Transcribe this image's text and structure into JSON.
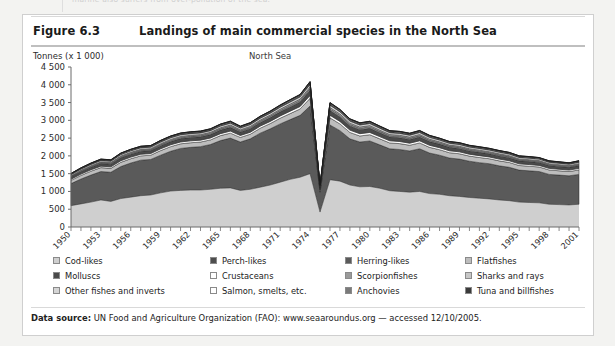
{
  "page": {
    "cut_off_top_fragment": "marine also suffers from over-pollution of the sea."
  },
  "figure": {
    "number_label": "Figure 6.3",
    "title": "Landings of main commercial species in the North Sea",
    "footer_prefix": "Data source:",
    "footer_text": " UN Food and Agriculture Organization (FAO): www.seaaroundus.org — accessed 12/10/2005."
  },
  "colors": {
    "cod_likes": "#cfcfcf",
    "perch_likes": "#4d4d4d",
    "herring_likes": "#5a5a5a",
    "flatfishes": "#bdbdbd",
    "molluscs": "#4a4a4a",
    "crustaceans": "#ffffff",
    "scorpionfishes": "#9a9a9a",
    "sharks_and_rays": "#c7c7c7",
    "other_fishes_and_inverts": "#d5d5d5",
    "salmon_smelts": "#ffffff",
    "anchovies": "#7a7a7a",
    "tuna_and_billfishes": "#3a3a3a",
    "axis": "#6b6b6b",
    "outline": "#1a1a1a",
    "panel_border": "#cfcfcf"
  },
  "legend": {
    "rows": [
      [
        {
          "label": "Cod-likes",
          "color_key": "cod_likes"
        },
        {
          "label": "Perch-likes",
          "color_key": "perch_likes"
        },
        {
          "label": "Herring-likes",
          "color_key": "herring_likes"
        },
        {
          "label": "Flatfishes",
          "color_key": "flatfishes"
        }
      ],
      [
        {
          "label": "Molluscs",
          "color_key": "molluscs"
        },
        {
          "label": "Crustaceans",
          "color_key": "crustaceans"
        },
        {
          "label": "Scorpionfishes",
          "color_key": "scorpionfishes"
        },
        {
          "label": "Sharks and rays",
          "color_key": "sharks_and_rays"
        }
      ],
      [
        {
          "label": "Other fishes and inverts",
          "color_key": "other_fishes_and_inverts"
        },
        {
          "label": "Salmon, smelts, etc.",
          "color_key": "salmon_smelts"
        },
        {
          "label": "Anchovies",
          "color_key": "anchovies"
        },
        {
          "label": "Tuna and billfishes",
          "color_key": "tuna_and_billfishes"
        }
      ]
    ]
  },
  "chart_data": {
    "type": "area",
    "stacked": true,
    "title": "North Sea",
    "xlabel": "",
    "ylabel": "Tonnes (x 1 000)",
    "ylim": [
      0,
      4500
    ],
    "yticks": [
      0,
      500,
      1000,
      1500,
      2000,
      2500,
      3000,
      3500,
      4000,
      4500
    ],
    "ytick_labels": [
      "0",
      "500",
      "1 000",
      "1 500",
      "2 000",
      "2 500",
      "3 000",
      "3 500",
      "4 000",
      "4 500"
    ],
    "grid": false,
    "legend_position": "below",
    "x": [
      1950,
      1951,
      1952,
      1953,
      1954,
      1955,
      1956,
      1957,
      1958,
      1959,
      1960,
      1961,
      1962,
      1963,
      1964,
      1965,
      1966,
      1967,
      1968,
      1969,
      1970,
      1971,
      1972,
      1973,
      1974,
      1975,
      1976,
      1977,
      1978,
      1979,
      1980,
      1981,
      1982,
      1983,
      1984,
      1985,
      1986,
      1987,
      1988,
      1989,
      1990,
      1991,
      1992,
      1993,
      1994,
      1995,
      1996,
      1997,
      1998,
      1999,
      2000,
      2001
    ],
    "xtick_labels": [
      "1950",
      "1953",
      "1956",
      "1959",
      "1962",
      "1965",
      "1968",
      "1971",
      "1974",
      "1977",
      "1980",
      "1983",
      "1986",
      "1989",
      "1992",
      "1995",
      "1998",
      "2001"
    ],
    "series": [
      {
        "name": "Cod-likes",
        "color_key": "cod_likes",
        "values": [
          600,
          650,
          700,
          760,
          720,
          800,
          840,
          880,
          900,
          960,
          1010,
          1030,
          1040,
          1040,
          1060,
          1090,
          1100,
          1030,
          1060,
          1120,
          1180,
          1260,
          1340,
          1400,
          1500,
          420,
          1330,
          1290,
          1180,
          1130,
          1140,
          1090,
          1020,
          1000,
          980,
          1000,
          940,
          920,
          880,
          860,
          830,
          810,
          790,
          760,
          740,
          700,
          690,
          680,
          640,
          630,
          620,
          640
        ]
      },
      {
        "name": "Herring-likes",
        "color_key": "herring_likes",
        "values": [
          620,
          700,
          760,
          800,
          820,
          900,
          960,
          1000,
          1000,
          1060,
          1120,
          1180,
          1200,
          1220,
          1260,
          1340,
          1400,
          1360,
          1420,
          1520,
          1580,
          1640,
          1680,
          1740,
          1900,
          560,
          1540,
          1420,
          1300,
          1260,
          1280,
          1220,
          1180,
          1180,
          1160,
          1200,
          1140,
          1100,
          1060,
          1050,
          1020,
          1000,
          990,
          960,
          940,
          900,
          890,
          880,
          840,
          830,
          820,
          840
        ]
      },
      {
        "name": "Flatfishes",
        "color_key": "flatfishes",
        "values": [
          90,
          100,
          110,
          110,
          110,
          120,
          120,
          120,
          120,
          130,
          130,
          130,
          130,
          130,
          130,
          140,
          140,
          130,
          130,
          140,
          150,
          160,
          170,
          180,
          220,
          60,
          200,
          190,
          180,
          170,
          175,
          170,
          165,
          165,
          160,
          165,
          160,
          155,
          150,
          150,
          145,
          145,
          140,
          140,
          135,
          130,
          130,
          128,
          125,
          122,
          120,
          125
        ]
      },
      {
        "name": "Crustaceans",
        "color_key": "crustaceans",
        "values": [
          35,
          38,
          40,
          42,
          42,
          45,
          46,
          47,
          47,
          50,
          52,
          52,
          53,
          53,
          54,
          56,
          58,
          55,
          56,
          58,
          60,
          64,
          68,
          70,
          80,
          22,
          74,
          70,
          66,
          64,
          65,
          62,
          60,
          60,
          58,
          60,
          58,
          56,
          54,
          54,
          52,
          52,
          50,
          50,
          48,
          46,
          46,
          45,
          44,
          43,
          42,
          44
        ]
      },
      {
        "name": "Molluscs",
        "color_key": "molluscs",
        "values": [
          60,
          66,
          70,
          74,
          74,
          80,
          82,
          84,
          84,
          88,
          92,
          94,
          95,
          95,
          96,
          100,
          104,
          98,
          100,
          104,
          108,
          114,
          120,
          126,
          145,
          40,
          132,
          126,
          118,
          114,
          116,
          110,
          106,
          106,
          104,
          108,
          104,
          100,
          98,
          96,
          94,
          94,
          90,
          90,
          88,
          84,
          84,
          82,
          80,
          78,
          76,
          80
        ]
      },
      {
        "name": "Scorpionfishes",
        "color_key": "scorpionfishes",
        "values": [
          20,
          22,
          24,
          25,
          25,
          27,
          28,
          28,
          28,
          30,
          31,
          32,
          32,
          32,
          33,
          34,
          35,
          33,
          34,
          35,
          37,
          39,
          41,
          43,
          50,
          14,
          45,
          43,
          40,
          39,
          40,
          38,
          36,
          36,
          35,
          37,
          35,
          34,
          33,
          33,
          32,
          32,
          31,
          31,
          30,
          29,
          29,
          28,
          27,
          27,
          26,
          27
        ]
      },
      {
        "name": "Sharks and rays",
        "color_key": "sharks_and_rays",
        "values": [
          18,
          20,
          21,
          22,
          22,
          24,
          25,
          25,
          25,
          26,
          28,
          28,
          29,
          29,
          29,
          30,
          31,
          29,
          30,
          31,
          33,
          35,
          37,
          38,
          44,
          12,
          40,
          38,
          36,
          35,
          36,
          34,
          33,
          33,
          32,
          33,
          32,
          30,
          29,
          29,
          28,
          28,
          27,
          27,
          26,
          25,
          25,
          25,
          24,
          24,
          23,
          24
        ]
      },
      {
        "name": "Other fishes and inverts",
        "color_key": "other_fishes_and_inverts",
        "values": [
          30,
          33,
          35,
          37,
          37,
          40,
          41,
          42,
          42,
          44,
          46,
          47,
          47,
          47,
          48,
          50,
          52,
          49,
          50,
          52,
          54,
          57,
          60,
          63,
          72,
          20,
          66,
          63,
          59,
          57,
          58,
          55,
          53,
          53,
          52,
          54,
          52,
          50,
          49,
          48,
          47,
          47,
          45,
          45,
          44,
          42,
          42,
          41,
          40,
          39,
          38,
          40
        ]
      },
      {
        "name": "Perch-likes",
        "color_key": "perch_likes",
        "values": [
          15,
          16,
          17,
          18,
          18,
          20,
          20,
          21,
          21,
          22,
          23,
          23,
          24,
          24,
          24,
          25,
          26,
          24,
          25,
          26,
          27,
          29,
          30,
          31,
          36,
          10,
          33,
          31,
          29,
          29,
          29,
          27,
          26,
          26,
          26,
          27,
          26,
          25,
          24,
          24,
          23,
          23,
          23,
          22,
          22,
          21,
          21,
          20,
          20,
          19,
          19,
          20
        ]
      },
      {
        "name": "Salmon, smelts, etc.",
        "color_key": "salmon_smelts",
        "values": [
          8,
          9,
          9,
          10,
          10,
          10,
          11,
          11,
          11,
          12,
          12,
          12,
          13,
          13,
          13,
          13,
          14,
          13,
          13,
          14,
          14,
          15,
          16,
          17,
          19,
          5,
          18,
          17,
          16,
          15,
          15,
          15,
          14,
          14,
          14,
          14,
          14,
          13,
          13,
          13,
          12,
          12,
          12,
          12,
          12,
          11,
          11,
          11,
          10,
          10,
          10,
          11
        ]
      },
      {
        "name": "Anchovies",
        "color_key": "anchovies",
        "values": [
          6,
          6,
          7,
          7,
          7,
          8,
          8,
          8,
          8,
          9,
          9,
          9,
          9,
          9,
          10,
          10,
          10,
          9,
          10,
          10,
          11,
          11,
          12,
          12,
          14,
          4,
          13,
          12,
          11,
          11,
          11,
          11,
          10,
          10,
          10,
          10,
          10,
          10,
          9,
          9,
          9,
          9,
          9,
          8,
          8,
          8,
          8,
          8,
          7,
          7,
          7,
          8
        ]
      },
      {
        "name": "Tuna and billfishes",
        "color_key": "tuna_and_billfishes",
        "values": [
          4,
          4,
          5,
          5,
          5,
          5,
          5,
          6,
          6,
          6,
          6,
          6,
          6,
          6,
          6,
          7,
          7,
          6,
          7,
          7,
          7,
          8,
          8,
          8,
          10,
          3,
          9,
          8,
          8,
          7,
          8,
          7,
          7,
          7,
          7,
          7,
          7,
          6,
          6,
          6,
          6,
          6,
          6,
          6,
          6,
          5,
          5,
          5,
          5,
          5,
          5,
          5
        ]
      }
    ],
    "totals_note": "Peak total approx. 4 050 in 1974; approx. 2 700 by 2001",
    "annotations": []
  }
}
